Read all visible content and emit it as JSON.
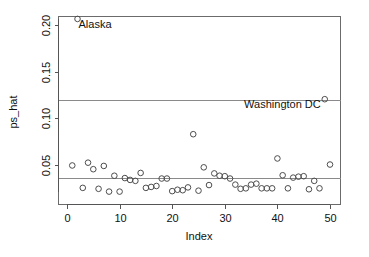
{
  "chart_data": {
    "type": "scatter",
    "title": "",
    "xlabel": "Index",
    "ylabel": "ps_hat",
    "xlim": [
      0,
      52
    ],
    "ylim": [
      0.0,
      0.215
    ],
    "grid": false,
    "legend": "none",
    "x_ticks": [
      0,
      10,
      20,
      30,
      40,
      50
    ],
    "x_tick_labels": [
      "0",
      "10",
      "20",
      "30",
      "40",
      "50"
    ],
    "y_ticks": [
      0.05,
      0.1,
      0.15,
      0.2
    ],
    "y_tick_labels": [
      "0.05",
      "0.10",
      "0.15",
      "0.20"
    ],
    "reference_lines": [
      {
        "name": "upper-reference-line",
        "y": 0.12
      },
      {
        "name": "lower-reference-line",
        "y": 0.0365
      }
    ],
    "annotations": [
      {
        "text": "Alaska",
        "x": 2,
        "y": 0.2065,
        "anchor": "start"
      },
      {
        "text": "Washington DC",
        "x": 49,
        "y": 0.1205,
        "anchor": "end"
      }
    ],
    "x": [
      1,
      2,
      3,
      4,
      5,
      6,
      7,
      8,
      9,
      10,
      11,
      12,
      13,
      14,
      15,
      16,
      17,
      18,
      19,
      20,
      21,
      22,
      23,
      24,
      25,
      26,
      27,
      28,
      29,
      30,
      31,
      32,
      33,
      34,
      35,
      36,
      37,
      38,
      39,
      40,
      41,
      42,
      43,
      44,
      45,
      46,
      47,
      48,
      49,
      50
    ],
    "y": [
      0.0495,
      0.2065,
      0.0255,
      0.0525,
      0.0455,
      0.0245,
      0.049,
      0.0215,
      0.0385,
      0.0215,
      0.036,
      0.034,
      0.033,
      0.0415,
      0.0255,
      0.0265,
      0.0275,
      0.0355,
      0.0355,
      0.022,
      0.0235,
      0.023,
      0.026,
      0.083,
      0.0225,
      0.0475,
      0.0285,
      0.041,
      0.0385,
      0.038,
      0.0355,
      0.029,
      0.0245,
      0.025,
      0.029,
      0.03,
      0.025,
      0.025,
      0.025,
      0.057,
      0.039,
      0.025,
      0.0365,
      0.0375,
      0.038,
      0.024,
      0.033,
      0.025,
      0.1205,
      0.0505
    ],
    "marker": {
      "shape": "circle-open",
      "radius_px": 2.8,
      "color": "#4d4d4d"
    }
  },
  "axes": {
    "x_title": "Index",
    "y_title": "ps_hat"
  }
}
